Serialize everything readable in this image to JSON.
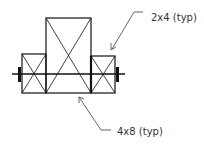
{
  "diagram": {
    "type": "structural-section",
    "labels": {
      "top": "2x4 (typ)",
      "bottom": "4x8 (typ)"
    },
    "members": [
      {
        "name": "left-2x4",
        "x": 22,
        "y": 54,
        "w": 24,
        "h": 39
      },
      {
        "name": "center-4x8",
        "x": 46,
        "y": 18,
        "w": 45,
        "h": 75
      },
      {
        "name": "right-2x4",
        "x": 91,
        "y": 56,
        "w": 24,
        "h": 37
      }
    ],
    "colors": {
      "line": "#111111",
      "leader": "#555555",
      "text": "#333333"
    }
  }
}
